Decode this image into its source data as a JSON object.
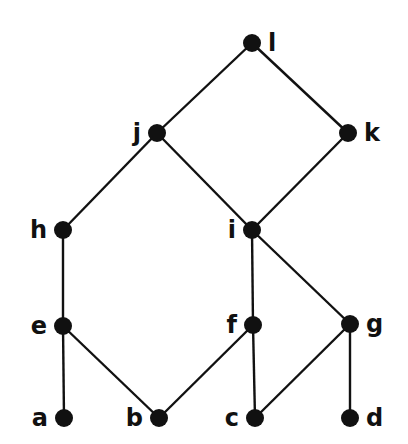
{
  "diagram": {
    "type": "hasse-diagram",
    "colors": {
      "background": "#ffffff",
      "ink": "#111111"
    },
    "nodes": [
      {
        "id": "l",
        "label": "l",
        "x": 252,
        "y": 43,
        "label_side": "right"
      },
      {
        "id": "j",
        "label": "j",
        "x": 157,
        "y": 133,
        "label_side": "left"
      },
      {
        "id": "k",
        "label": "k",
        "x": 348,
        "y": 133,
        "label_side": "right"
      },
      {
        "id": "h",
        "label": "h",
        "x": 63,
        "y": 230,
        "label_side": "left"
      },
      {
        "id": "i",
        "label": "i",
        "x": 252,
        "y": 230,
        "label_side": "left"
      },
      {
        "id": "e",
        "label": "e",
        "x": 63,
        "y": 326,
        "label_side": "left"
      },
      {
        "id": "f",
        "label": "f",
        "x": 253,
        "y": 325,
        "label_side": "left"
      },
      {
        "id": "g",
        "label": "g",
        "x": 350,
        "y": 324,
        "label_side": "right"
      },
      {
        "id": "a",
        "label": "a",
        "x": 64,
        "y": 418,
        "label_side": "left"
      },
      {
        "id": "b",
        "label": "b",
        "x": 159,
        "y": 418,
        "label_side": "left"
      },
      {
        "id": "c",
        "label": "c",
        "x": 255,
        "y": 418,
        "label_side": "left"
      },
      {
        "id": "d",
        "label": "d",
        "x": 350,
        "y": 418,
        "label_side": "right"
      }
    ],
    "edges": [
      [
        "l",
        "j"
      ],
      [
        "l",
        "k"
      ],
      [
        "j",
        "h"
      ],
      [
        "j",
        "i"
      ],
      [
        "k",
        "i"
      ],
      [
        "h",
        "e"
      ],
      [
        "i",
        "f"
      ],
      [
        "i",
        "g"
      ],
      [
        "e",
        "a"
      ],
      [
        "e",
        "b"
      ],
      [
        "f",
        "b"
      ],
      [
        "f",
        "c"
      ],
      [
        "g",
        "c"
      ],
      [
        "g",
        "d"
      ]
    ]
  }
}
